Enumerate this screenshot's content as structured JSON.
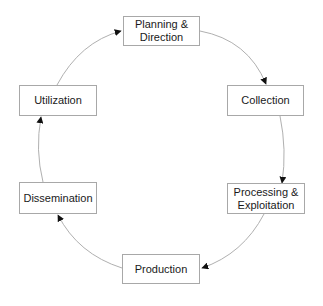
{
  "diagram": {
    "type": "cycle",
    "nodes": [
      {
        "id": "planning",
        "label": "Planning &\nDirection",
        "x": 123,
        "y": 16,
        "w": 77,
        "h": 30
      },
      {
        "id": "collection",
        "label": "Collection",
        "x": 227,
        "y": 85,
        "w": 77,
        "h": 31
      },
      {
        "id": "processing",
        "label": "Processing &\nExploitation",
        "x": 227,
        "y": 183,
        "w": 78,
        "h": 31
      },
      {
        "id": "production",
        "label": "Production",
        "x": 122,
        "y": 254,
        "w": 78,
        "h": 30
      },
      {
        "id": "dissemination",
        "label": "Dissemination",
        "x": 19,
        "y": 182,
        "w": 78,
        "h": 32
      },
      {
        "id": "utilization",
        "label": "Utilization",
        "x": 19,
        "y": 85,
        "w": 78,
        "h": 31
      }
    ],
    "edges": [
      {
        "from": "planning",
        "to": "collection"
      },
      {
        "from": "collection",
        "to": "processing"
      },
      {
        "from": "processing",
        "to": "production"
      },
      {
        "from": "production",
        "to": "dissemination"
      },
      {
        "from": "dissemination",
        "to": "utilization"
      },
      {
        "from": "utilization",
        "to": "planning"
      }
    ],
    "colors": {
      "edge": "#b0b0b0",
      "arrowhead": "#111111",
      "box_border": "#a8a8a8",
      "text": "#1a1a1a"
    }
  }
}
